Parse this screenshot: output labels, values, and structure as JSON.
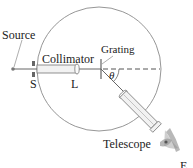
{
  "diagram": {
    "type": "grating-spectrometer",
    "labels": {
      "source": "Source",
      "collimator": "Collimator",
      "grating": "Grating",
      "slit": "S",
      "lens": "L",
      "angle": "θ",
      "telescope": "Telescope",
      "eye": "E"
    },
    "colors": {
      "line": "#555555",
      "circle": "#8a8a8a",
      "text": "#222222",
      "tube_fill": "#f2f2f2",
      "slit": "#666666"
    }
  }
}
